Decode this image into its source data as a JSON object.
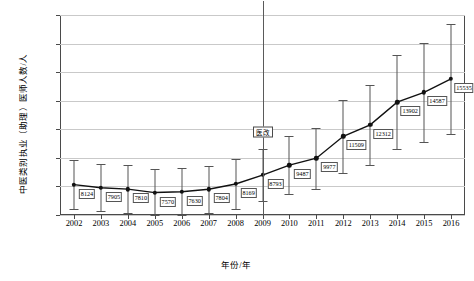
{
  "chart_data": {
    "type": "line",
    "title": "",
    "xlabel": "年份/年",
    "ylabel": "中医类别执业（助理）医师人数/人",
    "categories": [
      2002,
      2003,
      2004,
      2005,
      2006,
      2007,
      2008,
      2009,
      2010,
      2011,
      2012,
      2013,
      2014,
      2015,
      2016
    ],
    "values": [
      8124,
      7905,
      7810,
      7570,
      7630,
      7804,
      8169,
      8793,
      9487,
      9977,
      11509,
      12312,
      13902,
      14587,
      15535
    ],
    "value_labels": [
      "8124",
      "7905",
      "7810",
      "7570",
      "7630",
      "7804",
      "8169",
      "8793",
      "9487",
      "9977",
      "11509",
      "12312",
      "13902",
      "14587",
      "15535"
    ],
    "error_low": [
      6400,
      6250,
      6150,
      5950,
      6000,
      6150,
      6450,
      6950,
      7450,
      7850,
      8950,
      9500,
      10600,
      11100,
      11700
    ],
    "error_high": [
      9850,
      9560,
      9470,
      9190,
      9260,
      9460,
      9890,
      10640,
      11520,
      12100,
      14070,
      15120,
      17200,
      18070,
      19370
    ],
    "ylim": [
      6000,
      20000
    ],
    "yticks": [
      6000,
      8000,
      10000,
      12000,
      14000,
      16000,
      18000,
      20000
    ],
    "ytick_labels": [
      "6 000",
      "8 000",
      "10 000",
      "12 000",
      "14 000",
      "16 000",
      "18 000",
      "20 000"
    ],
    "grid": true,
    "legend": "none",
    "annotations": [
      {
        "name": "reference-line-2009",
        "x": 2009,
        "label": "医改",
        "label_y": 11800
      }
    ],
    "series_color": "#111111",
    "grid_color": "#c9c9c9",
    "error_color": "#555555"
  }
}
